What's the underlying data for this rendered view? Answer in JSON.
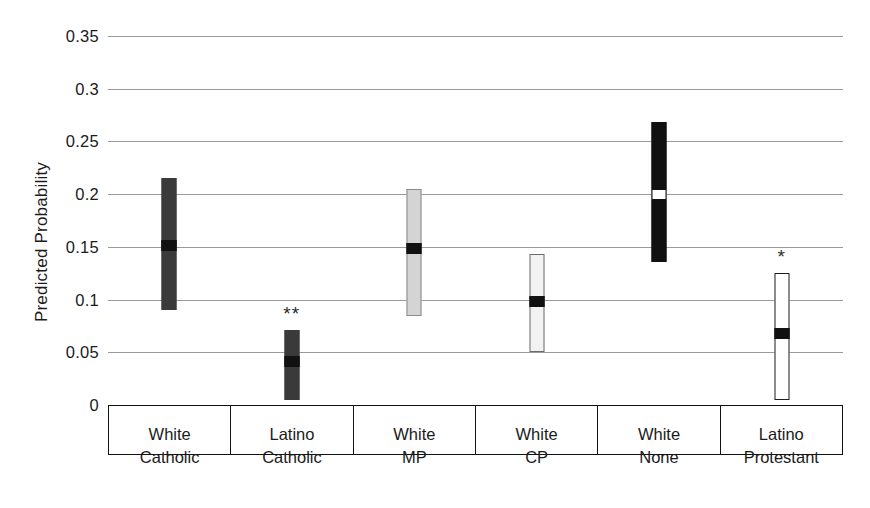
{
  "chart_data": {
    "type": "bar",
    "title": "",
    "xlabel": "",
    "ylabel": "Predicted Probability",
    "ylim": [
      0,
      0.35
    ],
    "yticks": [
      "0",
      "0.05",
      "0.1",
      "0.15",
      "0.2",
      "0.25",
      "0.3",
      "0.35"
    ],
    "ytick_values": [
      0,
      0.05,
      0.1,
      0.15,
      0.2,
      0.25,
      0.3,
      0.35
    ],
    "grid": true,
    "legend": "none",
    "categories": [
      "White Catholic",
      "Latino Catholic",
      "White MP",
      "White CP",
      "White None",
      "Latino Protestant"
    ],
    "category_lines": [
      [
        "White",
        "Catholic"
      ],
      [
        "Latino",
        "Catholic"
      ],
      [
        "White",
        "MP"
      ],
      [
        "White",
        "CP"
      ],
      [
        "White",
        "None"
      ],
      [
        "Latino",
        "Protestant"
      ]
    ],
    "series": [
      {
        "name": "Predicted probability with confidence interval",
        "points": [
          {
            "category": "White Catholic",
            "value": 0.151,
            "ci_low": 0.09,
            "ci_high": 0.215,
            "fill": "#3a3a3a",
            "border": "#3a3a3a",
            "marker_fill": "#111111",
            "significance": ""
          },
          {
            "category": "Latino Catholic",
            "value": 0.041,
            "ci_low": 0.005,
            "ci_high": 0.071,
            "fill": "#3a3a3a",
            "border": "#3a3a3a",
            "marker_fill": "#111111",
            "significance": "**"
          },
          {
            "category": "White MP",
            "value": 0.148,
            "ci_low": 0.084,
            "ci_high": 0.205,
            "fill": "#d4d4d4",
            "border": "#8a8a8a",
            "marker_fill": "#111111",
            "significance": ""
          },
          {
            "category": "White CP",
            "value": 0.098,
            "ci_low": 0.05,
            "ci_high": 0.143,
            "fill": "#f2f2f2",
            "border": "#6a6a6a",
            "marker_fill": "#111111",
            "significance": ""
          },
          {
            "category": "White None",
            "value": 0.2,
            "ci_low": 0.136,
            "ci_high": 0.268,
            "fill": "#111111",
            "border": "#111111",
            "marker_fill": "#ffffff",
            "significance": ""
          },
          {
            "category": "Latino Protestant",
            "value": 0.068,
            "ci_low": 0.005,
            "ci_high": 0.125,
            "fill": "#ffffff",
            "border": "#1b1b1b",
            "marker_fill": "#111111",
            "significance": "*"
          }
        ]
      }
    ]
  },
  "colors": {
    "gridline": "#9a9a9a",
    "axis": "#111111",
    "text": "#1b1b1b",
    "background": "#ffffff"
  }
}
